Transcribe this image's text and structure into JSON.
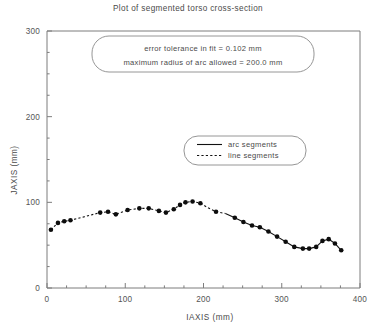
{
  "figure": {
    "title": "Plot of segmented torso cross-section",
    "background": "#ffffff",
    "foreground": "#3a3a3a"
  },
  "annotation": {
    "line1": "error tolerance in fit = 0.102 mm",
    "line2": "maximum radius of arc allowed = 200.0 mm"
  },
  "legend": {
    "entries": [
      {
        "label": "arc segments",
        "style": "solid"
      },
      {
        "label": "line segments",
        "style": "dashed"
      }
    ]
  },
  "chart_data": {
    "type": "scatter",
    "title": "Plot of segmented torso cross-section",
    "xlabel": "IAXIS (mm)",
    "ylabel": "JAXIS (mm)",
    "xlim": [
      0,
      400
    ],
    "ylim": [
      0,
      300
    ],
    "xticks": [
      0,
      100,
      200,
      300,
      400
    ],
    "yticks": [
      0,
      100,
      200,
      300
    ],
    "xminor_step": 25,
    "yminor_step": 25,
    "grid": false,
    "legend_position": "center-right",
    "marker": "filled-circle",
    "marker_size": 4.6,
    "series": [
      {
        "name": "line segments",
        "style": "dashed",
        "x": [
          5,
          14,
          22,
          30,
          68,
          78,
          88,
          103,
          118,
          130,
          143,
          152,
          162,
          170,
          177,
          186,
          196,
          205,
          216,
          228
        ],
        "y": [
          68,
          76,
          78,
          79,
          88,
          89,
          86,
          91,
          93,
          93,
          90,
          88,
          92,
          97,
          100,
          101,
          99,
          94,
          89,
          87
        ]
      },
      {
        "name": "arc segments",
        "style": "solid",
        "x": [
          228,
          240,
          251,
          262,
          272,
          283,
          294,
          305,
          316,
          327,
          335,
          344,
          352,
          360,
          368,
          376
        ],
        "y": [
          87,
          82,
          77,
          73,
          71,
          66,
          60,
          54,
          48,
          46,
          46,
          48,
          55,
          57,
          52,
          44
        ]
      }
    ],
    "points": [
      {
        "x": 5,
        "y": 68
      },
      {
        "x": 14,
        "y": 76
      },
      {
        "x": 22,
        "y": 78
      },
      {
        "x": 30,
        "y": 79
      },
      {
        "x": 68,
        "y": 88
      },
      {
        "x": 78,
        "y": 89
      },
      {
        "x": 88,
        "y": 86
      },
      {
        "x": 103,
        "y": 91
      },
      {
        "x": 118,
        "y": 93
      },
      {
        "x": 130,
        "y": 93
      },
      {
        "x": 143,
        "y": 90
      },
      {
        "x": 152,
        "y": 88
      },
      {
        "x": 162,
        "y": 92
      },
      {
        "x": 170,
        "y": 97
      },
      {
        "x": 177,
        "y": 100
      },
      {
        "x": 186,
        "y": 101
      },
      {
        "x": 196,
        "y": 99
      },
      {
        "x": 216,
        "y": 89
      },
      {
        "x": 240,
        "y": 82
      },
      {
        "x": 251,
        "y": 77
      },
      {
        "x": 262,
        "y": 73
      },
      {
        "x": 272,
        "y": 71
      },
      {
        "x": 283,
        "y": 66
      },
      {
        "x": 294,
        "y": 60
      },
      {
        "x": 305,
        "y": 54
      },
      {
        "x": 316,
        "y": 48
      },
      {
        "x": 327,
        "y": 46
      },
      {
        "x": 335,
        "y": 46
      },
      {
        "x": 344,
        "y": 48
      },
      {
        "x": 352,
        "y": 55
      },
      {
        "x": 360,
        "y": 57
      },
      {
        "x": 368,
        "y": 52
      },
      {
        "x": 376,
        "y": 44
      }
    ]
  }
}
